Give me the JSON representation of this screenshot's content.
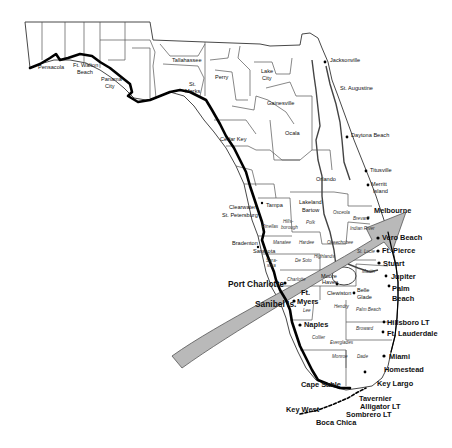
{
  "map": {
    "subject": "Florida",
    "track_arrow": {
      "color": "#b9b9b9",
      "stroke": "#555555",
      "direction": "southwest-to-northeast"
    },
    "cities": [
      {
        "name": "Pensacola",
        "x": 38,
        "y": 69,
        "size": "small"
      },
      {
        "name": "Ft. Walton",
        "x": 73,
        "y": 67,
        "size": "small"
      },
      {
        "name": "Beach",
        "x": 77,
        "y": 74,
        "size": "small"
      },
      {
        "name": "Panama",
        "x": 101,
        "y": 81,
        "size": "small"
      },
      {
        "name": "City",
        "x": 105,
        "y": 88,
        "size": "small"
      },
      {
        "name": "Tallahassee",
        "x": 172,
        "y": 62,
        "size": "small"
      },
      {
        "name": "St.",
        "x": 189,
        "y": 86,
        "size": "small"
      },
      {
        "name": "Marks",
        "x": 185,
        "y": 93,
        "size": "small"
      },
      {
        "name": "Perry",
        "x": 215,
        "y": 79,
        "size": "small"
      },
      {
        "name": "Lake",
        "x": 261,
        "y": 73,
        "size": "small"
      },
      {
        "name": "City",
        "x": 262,
        "y": 80,
        "size": "small"
      },
      {
        "name": "Gainesville",
        "x": 267,
        "y": 105,
        "size": "small"
      },
      {
        "name": "Ocala",
        "x": 285,
        "y": 135,
        "size": "small"
      },
      {
        "name": "Cedar Key",
        "x": 220,
        "y": 141,
        "size": "small"
      },
      {
        "name": "Jacksonville",
        "x": 330,
        "y": 62,
        "size": "small"
      },
      {
        "name": "St. Augustine",
        "x": 340,
        "y": 90,
        "size": "small"
      },
      {
        "name": "Daytona Beach",
        "x": 351,
        "y": 137,
        "size": "small"
      },
      {
        "name": "Titusville",
        "x": 366,
        "y": 171,
        "size": "small"
      },
      {
        "name": "Merritt",
        "x": 370,
        "y": 185,
        "size": "small"
      },
      {
        "name": "Island",
        "x": 372,
        "y": 192,
        "size": "small"
      },
      {
        "name": "Orlando",
        "x": 316,
        "y": 181,
        "size": "small"
      },
      {
        "name": "Lakeland",
        "x": 302,
        "y": 204,
        "size": "small"
      },
      {
        "name": "Bartow",
        "x": 304,
        "y": 212,
        "size": "small"
      },
      {
        "name": "Clearwater",
        "x": 229,
        "y": 209,
        "size": "small"
      },
      {
        "name": "St. Petersburg",
        "x": 223,
        "y": 217,
        "size": "small"
      },
      {
        "name": "Tampa",
        "x": 266,
        "y": 207,
        "size": "small"
      },
      {
        "name": "Bradenton",
        "x": 237,
        "y": 243,
        "size": "small"
      },
      {
        "name": "Sarasota",
        "x": 253,
        "y": 251,
        "size": "small"
      },
      {
        "name": "Melbourne",
        "x": 375,
        "y": 212,
        "size": "medium"
      },
      {
        "name": "Vero Beach",
        "x": 382,
        "y": 238,
        "size": "medium"
      },
      {
        "name": "Ft. Pierce",
        "x": 382,
        "y": 253,
        "size": "medium"
      },
      {
        "name": "Stuart",
        "x": 382,
        "y": 265,
        "size": "medium"
      },
      {
        "name": "Jupiter",
        "x": 391,
        "y": 278,
        "size": "medium"
      },
      {
        "name": "Palm",
        "x": 392,
        "y": 290,
        "size": "medium"
      },
      {
        "name": "Beach",
        "x": 392,
        "y": 300,
        "size": "medium"
      },
      {
        "name": "Hillsboro LT",
        "x": 386,
        "y": 325,
        "size": "medium"
      },
      {
        "name": "Ft. Lauderdale",
        "x": 384,
        "y": 336,
        "size": "medium"
      },
      {
        "name": "Miami",
        "x": 389,
        "y": 359,
        "size": "medium"
      },
      {
        "name": "Homestead",
        "x": 384,
        "y": 372,
        "size": "medium"
      },
      {
        "name": "Port Charlotte",
        "x": 221,
        "y": 285,
        "size": "large"
      },
      {
        "name": "Sanibel Is.",
        "x": 226,
        "y": 307,
        "size": "large"
      },
      {
        "name": "Ft.",
        "x": 302,
        "y": 295,
        "size": "medium"
      },
      {
        "name": "Myers",
        "x": 300,
        "y": 304,
        "size": "medium"
      },
      {
        "name": "Naples",
        "x": 305,
        "y": 327,
        "size": "medium"
      },
      {
        "name": "Moore",
        "x": 321,
        "y": 278,
        "size": "small"
      },
      {
        "name": "Haven",
        "x": 322,
        "y": 284,
        "size": "small"
      },
      {
        "name": "Clewiston",
        "x": 327,
        "y": 295,
        "size": "small"
      },
      {
        "name": "Belle",
        "x": 357,
        "y": 292,
        "size": "small"
      },
      {
        "name": "Glade",
        "x": 357,
        "y": 299,
        "size": "small"
      },
      {
        "name": "Cape Sable",
        "x": 301,
        "y": 386,
        "size": "medium"
      },
      {
        "name": "Key Largo",
        "x": 377,
        "y": 385,
        "size": "medium"
      },
      {
        "name": "Tavernier",
        "x": 359,
        "y": 400,
        "size": "medium"
      },
      {
        "name": "Alligator LT",
        "x": 361,
        "y": 408,
        "size": "medium"
      },
      {
        "name": "Sombrero LT",
        "x": 346,
        "y": 416,
        "size": "medium"
      },
      {
        "name": "Key West",
        "x": 286,
        "y": 412,
        "size": "medium"
      },
      {
        "name": "Boca Chica",
        "x": 316,
        "y": 424,
        "size": "medium"
      }
    ],
    "counties": [
      {
        "name": "Pinellas",
        "x": 262,
        "y": 228
      },
      {
        "name": "Hills-",
        "x": 283,
        "y": 223
      },
      {
        "name": "borough",
        "x": 281,
        "y": 229
      },
      {
        "name": "Polk",
        "x": 306,
        "y": 224
      },
      {
        "name": "Osceola",
        "x": 333,
        "y": 214
      },
      {
        "name": "Brevard",
        "x": 364,
        "y": 219
      },
      {
        "name": "Indian River",
        "x": 359,
        "y": 229
      },
      {
        "name": "Manatee",
        "x": 273,
        "y": 244
      },
      {
        "name": "Hardee",
        "x": 299,
        "y": 244
      },
      {
        "name": "Okeechobee",
        "x": 337,
        "y": 244
      },
      {
        "name": "Highlands",
        "x": 318,
        "y": 256
      },
      {
        "name": "St. Lucie",
        "x": 360,
        "y": 253
      },
      {
        "name": "Sara-",
        "x": 266,
        "y": 258
      },
      {
        "name": "sota",
        "x": 267,
        "y": 263
      },
      {
        "name": "De Soto",
        "x": 296,
        "y": 261
      },
      {
        "name": "Charlotte",
        "x": 285,
        "y": 280
      },
      {
        "name": "Martin",
        "x": 365,
        "y": 271
      },
      {
        "name": "Lee",
        "x": 303,
        "y": 312
      },
      {
        "name": "Hendry",
        "x": 334,
        "y": 308
      },
      {
        "name": "Palm Beach",
        "x": 360,
        "y": 311
      },
      {
        "name": "Broward",
        "x": 358,
        "y": 330
      },
      {
        "name": "Collier",
        "x": 314,
        "y": 339
      },
      {
        "name": "Everglades",
        "x": 332,
        "y": 343
      },
      {
        "name": "Monroe",
        "x": 334,
        "y": 358
      },
      {
        "name": "Dade",
        "x": 357,
        "y": 358
      }
    ]
  }
}
